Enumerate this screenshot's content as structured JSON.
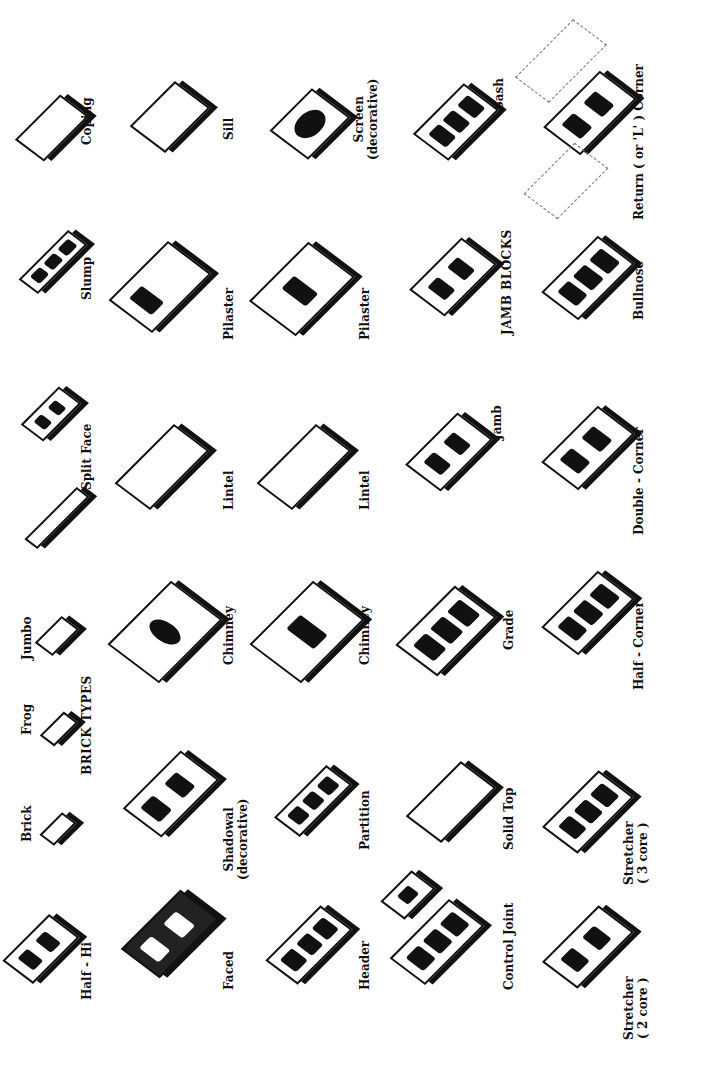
{
  "page": {
    "headers": {
      "brick_types": "BRICK TYPES",
      "jamb_blocks": "JAMB  BLOCKS"
    },
    "items": [
      {
        "label": "Half - Hi",
        "line2": ""
      },
      {
        "label": "Brick",
        "line2": ""
      },
      {
        "label": "Frog",
        "line2": ""
      },
      {
        "label": "Jumbo",
        "line2": ""
      },
      {
        "label": "Split Face",
        "line2": ""
      },
      {
        "label": "Slump",
        "line2": ""
      },
      {
        "label": "Coping",
        "line2": ""
      },
      {
        "label": "Faced",
        "line2": ""
      },
      {
        "label": "Shadowal",
        "line2": "(decorative)"
      },
      {
        "label": "Chimney",
        "line2": ""
      },
      {
        "label": "Lintel",
        "line2": ""
      },
      {
        "label": "Pilaster",
        "line2": ""
      },
      {
        "label": "Sill",
        "line2": ""
      },
      {
        "label": "Header",
        "line2": ""
      },
      {
        "label": "Partition",
        "line2": ""
      },
      {
        "label": "Chimney",
        "line2": ""
      },
      {
        "label": "Lintel",
        "line2": ""
      },
      {
        "label": "Pilaster",
        "line2": ""
      },
      {
        "label": "Screen",
        "line2": "(decorative)"
      },
      {
        "label": "Control Joint",
        "line2": ""
      },
      {
        "label": "Solid Top",
        "line2": ""
      },
      {
        "label": "Grade",
        "line2": ""
      },
      {
        "label": "Jamb",
        "line2": ""
      },
      {
        "label": "Sash",
        "line2": ""
      },
      {
        "label": "Stretcher",
        "line2": "( 2 core )"
      },
      {
        "label": "Stretcher",
        "line2": "( 3 core )"
      },
      {
        "label": "Half - Corner",
        "line2": ""
      },
      {
        "label": "Double - Corner",
        "line2": ""
      },
      {
        "label": "Bullnose",
        "line2": ""
      },
      {
        "label": "Return ( or 'L' ) Corner",
        "line2": ""
      }
    ]
  }
}
